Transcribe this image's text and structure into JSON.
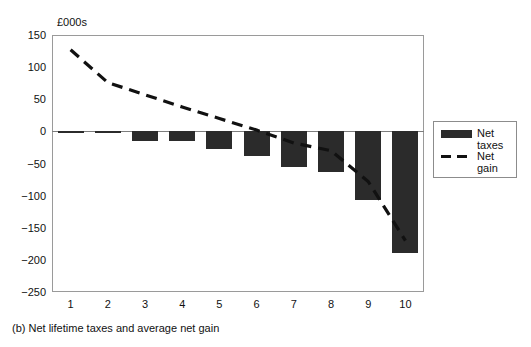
{
  "figure": {
    "caption": "(b) Net lifetime taxes and average net gain",
    "axis_unit_label": "£000s"
  },
  "legend": {
    "position": "right",
    "items": [
      {
        "label": "Net\ntaxes",
        "marker": "bar-swatch",
        "color": "#2b2b2b"
      },
      {
        "label": "Net\ngain",
        "marker": "dashed-line",
        "color": "#111111"
      }
    ]
  },
  "colors": {
    "bar": "#2b2b2b",
    "line": "#111111",
    "frame": "#9a9a9a",
    "zero_line": "#7d7d7d",
    "background": "#ffffff"
  },
  "chart_data": {
    "type": "bar",
    "title": "(b) Net lifetime taxes and average net gain",
    "xlabel": "",
    "ylabel": "£000s",
    "ylim": [
      -250,
      150
    ],
    "yticks": [
      150,
      100,
      50,
      0,
      -50,
      -100,
      -150,
      -200,
      -250
    ],
    "ytick_labels": [
      "150",
      "100",
      "50",
      "0",
      "−50",
      "−100",
      "−150",
      "−200",
      "−250"
    ],
    "categories": [
      "1",
      "2",
      "3",
      "4",
      "5",
      "6",
      "7",
      "8",
      "9",
      "10"
    ],
    "grid": false,
    "legend_position": "right",
    "series": [
      {
        "name": "Net taxes",
        "type": "bar",
        "color": "#2b2b2b",
        "values": [
          -2,
          -2,
          -15,
          -15,
          -27,
          -39,
          -56,
          -64,
          -107,
          -190
        ]
      },
      {
        "name": "Net gain",
        "type": "line",
        "style": "dashed",
        "color": "#111111",
        "values": [
          127,
          76,
          57,
          38,
          20,
          2,
          -18,
          -30,
          -78,
          -170
        ]
      }
    ]
  }
}
